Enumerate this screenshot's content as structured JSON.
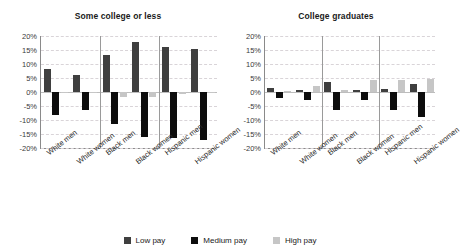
{
  "legend": {
    "items": [
      {
        "label": "Low pay",
        "color": "#3f3f3f",
        "key": "low"
      },
      {
        "label": "Medium pay",
        "color": "#0d0d0d",
        "key": "med"
      },
      {
        "label": "High pay",
        "color": "#c6c6c6",
        "key": "high"
      }
    ]
  },
  "axis": {
    "ticks": [
      "20%",
      "15%",
      "10%",
      "5%",
      "0%",
      "-5%",
      "-10%",
      "-15%",
      "-20%"
    ],
    "tick_values": [
      20,
      15,
      10,
      5,
      0,
      -5,
      -10,
      -15,
      -20
    ]
  },
  "chart_data": [
    {
      "type": "bar",
      "title": "Some college or less",
      "xlabel": "",
      "ylabel": "",
      "ylim": [
        -20,
        20
      ],
      "grid": true,
      "legend_position": "bottom",
      "categories": [
        "White men",
        "White women",
        "Black men",
        "Black women",
        "Hispanic men",
        "Hispanic women"
      ],
      "series": [
        {
          "name": "Low pay",
          "color": "#3f3f3f",
          "values": [
            8.3,
            6.2,
            13.3,
            18.0,
            16.2,
            15.5
          ]
        },
        {
          "name": "Medium pay",
          "color": "#0d0d0d",
          "values": [
            -8.2,
            -6.3,
            -11.4,
            -16.2,
            -16.4,
            -17.3
          ]
        },
        {
          "name": "High pay",
          "color": "#c6c6c6",
          "values": [
            -0.4,
            -0.3,
            -1.9,
            -1.7,
            -0.6,
            -0.3
          ]
        }
      ]
    },
    {
      "type": "bar",
      "title": "College graduates",
      "xlabel": "",
      "ylabel": "",
      "ylim": [
        -20,
        20
      ],
      "grid": true,
      "legend_position": "bottom",
      "categories": [
        "White men",
        "White women",
        "Black men",
        "Black women",
        "Hispanic men",
        "Hispanic women"
      ],
      "series": [
        {
          "name": "Low pay",
          "color": "#3f3f3f",
          "values": [
            1.5,
            0.6,
            3.6,
            0.7,
            0.9,
            2.8
          ]
        },
        {
          "name": "Medium pay",
          "color": "#0d0d0d",
          "values": [
            -2.0,
            -2.8,
            -6.4,
            -3.0,
            -6.6,
            -8.8
          ]
        },
        {
          "name": "High pay",
          "color": "#c6c6c6",
          "values": [
            0.2,
            2.3,
            0.6,
            4.4,
            4.4,
            4.6
          ]
        }
      ]
    }
  ]
}
